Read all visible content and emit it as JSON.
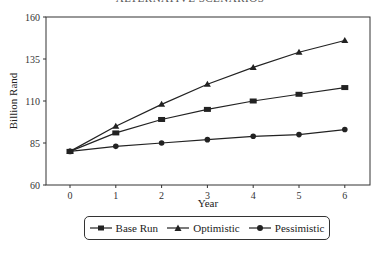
{
  "chart_data": {
    "type": "line",
    "title": "ALTERNATIVE SCENARIOS",
    "xlabel": "Year",
    "ylabel": "Billion Rand",
    "x": [
      0,
      1,
      2,
      3,
      4,
      5,
      6
    ],
    "xticks": [
      "0",
      "1",
      "2",
      "3",
      "4",
      "5",
      "6"
    ],
    "yticks": [
      "60",
      "85",
      "110",
      "135",
      "160"
    ],
    "ylim": [
      60,
      160
    ],
    "grid": false,
    "legend_position": "bottom",
    "series": [
      {
        "name": "Base Run",
        "marker": "square",
        "values": [
          80,
          91,
          99,
          105,
          110,
          114,
          118
        ]
      },
      {
        "name": "Optimistic",
        "marker": "triangle",
        "values": [
          80,
          95,
          108,
          120,
          130,
          139,
          146
        ]
      },
      {
        "name": "Pessimistic",
        "marker": "circle",
        "values": [
          80,
          83,
          85,
          87,
          89,
          90,
          93
        ]
      }
    ]
  },
  "legend": {
    "items": [
      "Base Run",
      "Optimistic",
      "Pessimistic"
    ]
  }
}
